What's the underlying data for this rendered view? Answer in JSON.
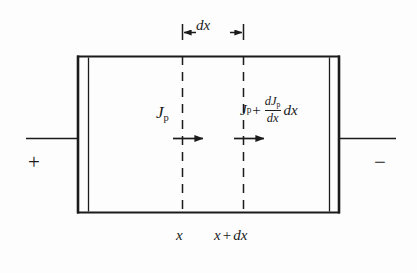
{
  "figure": {
    "background_color": "#fdfdfd",
    "ink_color": "#1b1b1b"
  },
  "dimension": {
    "label": "dx",
    "name": "dx-dimension"
  },
  "flux_left": {
    "symbol": "J",
    "subscript": "p"
  },
  "flux_right": {
    "symbol": "J",
    "subscript": "p",
    "operator": "+",
    "numerator_symbol": "dJ",
    "numerator_subscript": "p",
    "denominator": "dx",
    "trailing": "dx"
  },
  "terminals": {
    "left_polarity": "+",
    "right_polarity": "−"
  },
  "positions": {
    "left": "x",
    "right_base": "x",
    "right_operator": "+",
    "right_delta": "dx"
  },
  "arrows": {
    "left_name": "current-arrow-left",
    "right_name": "current-arrow-right"
  }
}
